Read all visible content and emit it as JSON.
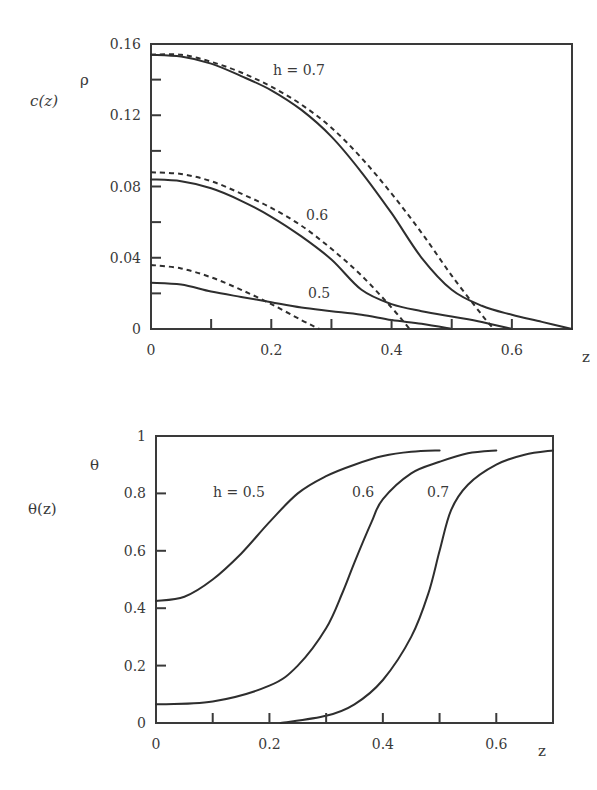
{
  "chart_data": [
    {
      "type": "line",
      "title": "",
      "ylabel": "c(z)",
      "ylabel_symbol": "ρ",
      "xlabel": "z",
      "xlim": [
        0,
        0.7
      ],
      "ylim": [
        0,
        0.16
      ],
      "x_ticks": [
        0,
        0.1,
        0.2,
        0.3,
        0.4,
        0.5,
        0.6
      ],
      "x_tick_labels": [
        "0",
        "0.2",
        "0.4",
        "0.6"
      ],
      "y_ticks": [
        0,
        0.02,
        0.04,
        0.06,
        0.08,
        0.1,
        0.12,
        0.14,
        0.16
      ],
      "y_tick_labels": [
        "0",
        "0.04",
        "0.08",
        "0.12",
        "0.16"
      ],
      "grid": false,
      "annotations": [
        "h = 0.7",
        "0.6",
        "0.5"
      ],
      "series": [
        {
          "name": "h = 0.7 (solid)",
          "style": "solid",
          "x": [
            0,
            0.05,
            0.1,
            0.15,
            0.2,
            0.25,
            0.3,
            0.35,
            0.4,
            0.45,
            0.5,
            0.55,
            0.6,
            0.65,
            0.7
          ],
          "y": [
            0.154,
            0.153,
            0.149,
            0.142,
            0.134,
            0.123,
            0.108,
            0.088,
            0.065,
            0.04,
            0.022,
            0.013,
            0.008,
            0.004,
            0.0
          ]
        },
        {
          "name": "h = 0.7 (dashed)",
          "style": "dashed",
          "x": [
            0,
            0.05,
            0.1,
            0.15,
            0.2,
            0.25,
            0.3,
            0.35,
            0.4,
            0.45,
            0.5,
            0.55,
            0.57
          ],
          "y": [
            0.154,
            0.154,
            0.15,
            0.144,
            0.136,
            0.126,
            0.113,
            0.096,
            0.076,
            0.054,
            0.03,
            0.008,
            0.0
          ]
        },
        {
          "name": "h = 0.6 (solid)",
          "style": "solid",
          "x": [
            0,
            0.05,
            0.1,
            0.15,
            0.2,
            0.25,
            0.3,
            0.35,
            0.4,
            0.45,
            0.5,
            0.55,
            0.6
          ],
          "y": [
            0.084,
            0.083,
            0.079,
            0.072,
            0.063,
            0.052,
            0.039,
            0.022,
            0.014,
            0.01,
            0.007,
            0.004,
            0.0
          ]
        },
        {
          "name": "h = 0.6 (dashed)",
          "style": "dashed",
          "x": [
            0,
            0.05,
            0.1,
            0.15,
            0.2,
            0.25,
            0.3,
            0.35,
            0.4,
            0.43
          ],
          "y": [
            0.088,
            0.087,
            0.083,
            0.076,
            0.068,
            0.058,
            0.045,
            0.03,
            0.012,
            0.0
          ]
        },
        {
          "name": "h = 0.5 (solid)",
          "style": "solid",
          "x": [
            0,
            0.05,
            0.1,
            0.15,
            0.2,
            0.25,
            0.3,
            0.35,
            0.4,
            0.45,
            0.5
          ],
          "y": [
            0.026,
            0.025,
            0.021,
            0.018,
            0.015,
            0.012,
            0.01,
            0.008,
            0.005,
            0.003,
            0.0
          ]
        },
        {
          "name": "h = 0.5 (dashed)",
          "style": "dashed",
          "x": [
            0,
            0.05,
            0.1,
            0.15,
            0.2,
            0.25,
            0.28
          ],
          "y": [
            0.036,
            0.034,
            0.029,
            0.022,
            0.014,
            0.005,
            0.0
          ]
        }
      ]
    },
    {
      "type": "line",
      "title": "",
      "ylabel": "θ(z)",
      "ylabel_symbol": "θ",
      "xlabel": "z",
      "xlim": [
        0,
        0.7
      ],
      "ylim": [
        0,
        1
      ],
      "x_ticks": [
        0,
        0.1,
        0.2,
        0.3,
        0.4,
        0.5,
        0.6
      ],
      "x_tick_labels": [
        "0",
        "0.2",
        "0.4",
        "0.6"
      ],
      "y_ticks": [
        0,
        0.2,
        0.4,
        0.6,
        0.8,
        1
      ],
      "y_tick_labels": [
        "0",
        "0.2",
        "0.4",
        "0.6",
        "0.8",
        "1"
      ],
      "grid": false,
      "annotations": [
        "h = 0.5",
        "0.6",
        "0.7"
      ],
      "series": [
        {
          "name": "h = 0.5",
          "style": "solid",
          "x": [
            0,
            0.05,
            0.1,
            0.15,
            0.2,
            0.25,
            0.3,
            0.35,
            0.4,
            0.45,
            0.5
          ],
          "y": [
            0.425,
            0.44,
            0.5,
            0.59,
            0.7,
            0.8,
            0.86,
            0.9,
            0.93,
            0.945,
            0.95
          ]
        },
        {
          "name": "h = 0.6",
          "style": "solid",
          "x": [
            0,
            0.1,
            0.2,
            0.25,
            0.3,
            0.33,
            0.35,
            0.38,
            0.4,
            0.45,
            0.5,
            0.55,
            0.6
          ],
          "y": [
            0.065,
            0.075,
            0.13,
            0.2,
            0.33,
            0.46,
            0.56,
            0.7,
            0.78,
            0.87,
            0.91,
            0.94,
            0.95
          ]
        },
        {
          "name": "h = 0.7",
          "style": "solid",
          "x": [
            0.22,
            0.3,
            0.35,
            0.4,
            0.45,
            0.48,
            0.5,
            0.52,
            0.55,
            0.6,
            0.65,
            0.7
          ],
          "y": [
            0.0,
            0.025,
            0.065,
            0.15,
            0.3,
            0.45,
            0.6,
            0.74,
            0.83,
            0.9,
            0.935,
            0.95
          ]
        }
      ]
    }
  ],
  "plots": {
    "top": {
      "y_title": "c(z)",
      "y_symbol": "ρ",
      "x_title": "z",
      "label_h07": "h = 0.7",
      "label_h06": "0.6",
      "label_h05": "0.5"
    },
    "bottom": {
      "y_title": "θ(z)",
      "y_symbol": "θ",
      "x_title": "z",
      "label_h05": "h = 0.5",
      "label_h06": "0.6",
      "label_h07": "0.7"
    }
  }
}
